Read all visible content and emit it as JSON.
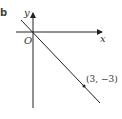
{
  "part_label": "b",
  "axes": {
    "x_label": "x",
    "y_label": "y",
    "origin_label": "O"
  },
  "line": {
    "passes_through": [
      "O",
      "(3, -3)"
    ],
    "equation": "y = -x"
  },
  "point": {
    "label": "(3, −3)",
    "x": 3,
    "y": -3
  },
  "colors": {
    "stroke": "#222222"
  }
}
